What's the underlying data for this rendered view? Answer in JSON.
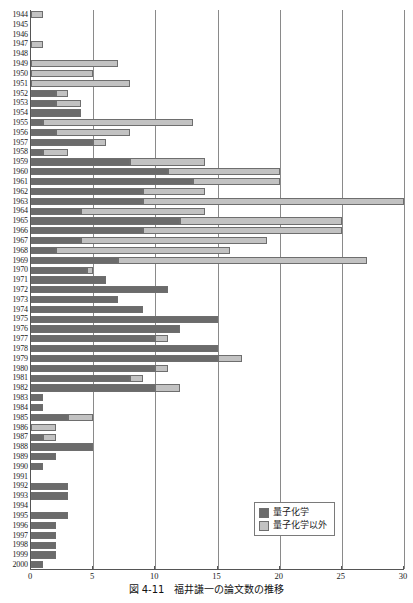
{
  "chart_data": {
    "type": "bar",
    "orientation": "horizontal",
    "stacked": true,
    "title": "",
    "caption": "図 4-11　福井謙一の論文数の推移",
    "xlabel": "",
    "ylabel": "",
    "xlim": [
      0,
      30
    ],
    "xticks": [
      0,
      5,
      10,
      15,
      20,
      25,
      30
    ],
    "grid": true,
    "legend_position": "bottom-right",
    "categories": [
      "1944",
      "1945",
      "1946",
      "1947",
      "1948",
      "1949",
      "1950",
      "1951",
      "1952",
      "1953",
      "1954",
      "1955",
      "1956",
      "1957",
      "1958",
      "1959",
      "1960",
      "1961",
      "1962",
      "1963",
      "1964",
      "1965",
      "1966",
      "1967",
      "1968",
      "1969",
      "1970",
      "1971",
      "1972",
      "1973",
      "1974",
      "1975",
      "1976",
      "1977",
      "1978",
      "1979",
      "1980",
      "1981",
      "1982",
      "1983",
      "1984",
      "1985",
      "1986",
      "1987",
      "1988",
      "1989",
      "1990",
      "1991",
      "1992",
      "1993",
      "1994",
      "1995",
      "1996",
      "1997",
      "1998",
      "1999",
      "2000"
    ],
    "series": [
      {
        "name": "量子化学",
        "color": "#6b6b6b",
        "values": [
          0,
          0,
          0,
          0,
          0,
          0,
          0,
          0,
          2,
          2,
          4,
          1,
          2,
          5,
          1,
          8,
          11,
          13,
          9,
          9,
          4,
          12,
          9,
          4,
          2,
          7,
          4.5,
          6,
          11,
          7,
          9,
          15,
          12,
          10,
          15,
          15,
          10,
          8,
          10,
          1,
          1,
          3,
          0,
          1,
          5,
          2,
          1,
          0,
          3,
          3,
          0,
          3,
          2,
          2,
          2,
          2,
          1
        ]
      },
      {
        "name": "量子化学以外",
        "color": "#c2c2c2",
        "values": [
          1,
          0,
          0,
          1,
          0,
          7,
          5,
          8,
          1,
          2,
          0,
          12,
          6,
          1,
          2,
          6,
          9,
          7,
          5,
          21,
          10,
          13,
          16,
          15,
          14,
          20,
          0.5,
          0,
          0,
          0,
          0,
          0,
          0,
          1,
          0,
          2,
          1,
          1,
          2,
          0,
          0,
          2,
          2,
          1,
          0,
          0,
          0,
          0,
          0,
          0,
          0,
          0,
          0,
          0,
          0,
          0,
          0
        ]
      }
    ],
    "totals": [
      1,
      0,
      0,
      1,
      0,
      7,
      5,
      8,
      3,
      4,
      4,
      13,
      8,
      6,
      3,
      14,
      20,
      20,
      14,
      30,
      14,
      25,
      25,
      19,
      16,
      27,
      5,
      6,
      11,
      7,
      9,
      15,
      12,
      11,
      15,
      17,
      11,
      9,
      12,
      1,
      1,
      5,
      2,
      2,
      5,
      2,
      1,
      0,
      3,
      3,
      0,
      3,
      2,
      2,
      2,
      2,
      1
    ]
  },
  "legend": {
    "items": [
      {
        "label": "量子化学",
        "swatch": "dark"
      },
      {
        "label": "量子化学以外",
        "swatch": "light"
      }
    ]
  }
}
